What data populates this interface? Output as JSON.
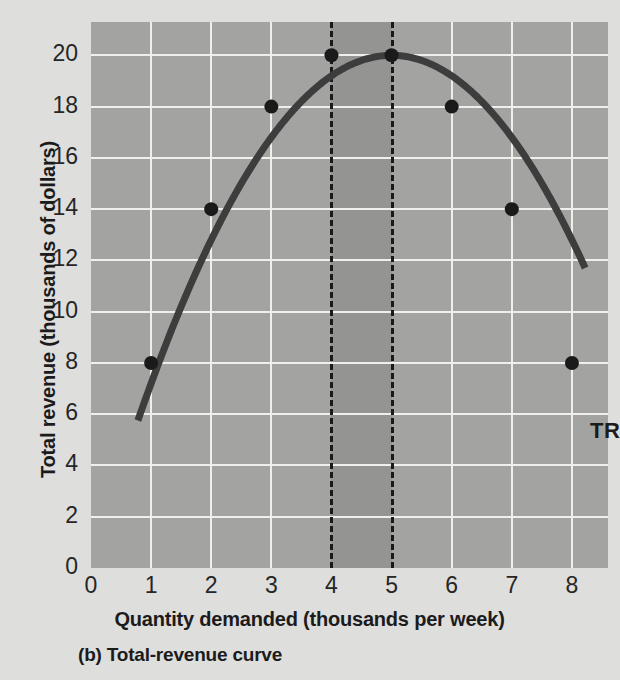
{
  "figure": {
    "caption": "(b) Total-revenue curve",
    "series_label": "TR"
  },
  "chart_data": {
    "type": "line",
    "title": "",
    "subtitle": "",
    "caption": "(b) Total-revenue curve",
    "xlabel": "Quantity demanded (thousands per week)",
    "ylabel": "Total revenue (thousands of dollars)",
    "xlim": [
      0,
      8.6
    ],
    "ylim": [
      0,
      21.3
    ],
    "xticks": [
      "0",
      "1",
      "2",
      "3",
      "4",
      "5",
      "6",
      "7",
      "8"
    ],
    "xtick_values": [
      0,
      1,
      2,
      3,
      4,
      5,
      6,
      7,
      8
    ],
    "yticks": [
      "0",
      "2",
      "4",
      "6",
      "8",
      "10",
      "12",
      "14",
      "16",
      "18",
      "20"
    ],
    "ytick_values": [
      0,
      2,
      4,
      6,
      8,
      10,
      12,
      14,
      16,
      18,
      20
    ],
    "grid": true,
    "legend": "none",
    "series": [
      {
        "name": "TR",
        "label": "TR",
        "marked_points": [
          {
            "x": 1,
            "y": 8
          },
          {
            "x": 2,
            "y": 14
          },
          {
            "x": 3,
            "y": 18
          },
          {
            "x": 4,
            "y": 20
          },
          {
            "x": 5,
            "y": 20
          },
          {
            "x": 6,
            "y": 18
          },
          {
            "x": 7,
            "y": 14
          },
          {
            "x": 8,
            "y": 8
          }
        ],
        "equation": "TR = 8q - 0.8q^2",
        "x_range": [
          0.78,
          8.22
        ],
        "peak": {
          "x": 4.5,
          "y": 20.25
        },
        "color": "#3d3d3d"
      }
    ],
    "annotations": [
      {
        "type": "vline",
        "x": 4,
        "style": "dashed",
        "color": "#1a1a1a"
      },
      {
        "type": "vline",
        "x": 5,
        "style": "dashed",
        "color": "#1a1a1a"
      },
      {
        "type": "vspan",
        "x0": 4,
        "x1": 5,
        "color": "#949492"
      },
      {
        "type": "text",
        "text": "TR",
        "x": 8.3,
        "y": 5.3
      }
    ],
    "colors": {
      "plot_background": "#a3a3a1",
      "page_background": "#dededc",
      "gridline": "#efefec",
      "band": "#949492",
      "curve": "#3d3d3d",
      "text": "#1b1b1b"
    }
  }
}
